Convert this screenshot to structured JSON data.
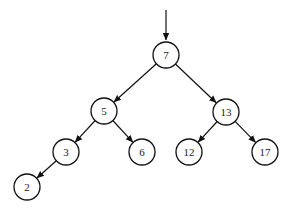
{
  "diagram": {
    "type": "binary-search-tree",
    "colors": {
      "stroke": "#111111",
      "text": "#222222",
      "background": "#ffffff"
    },
    "entry_arrow": {
      "x": 166,
      "y1": 10,
      "y2": 40
    },
    "node_radius": 13,
    "nodes": [
      {
        "id": "n7",
        "label": "7",
        "x": 166,
        "y": 55
      },
      {
        "id": "n5",
        "label": "5",
        "x": 104,
        "y": 111
      },
      {
        "id": "n13",
        "label": "13",
        "x": 226,
        "y": 112
      },
      {
        "id": "n3",
        "label": "3",
        "x": 66,
        "y": 152
      },
      {
        "id": "n6",
        "label": "6",
        "x": 142,
        "y": 152
      },
      {
        "id": "n12",
        "label": "12",
        "x": 189,
        "y": 152
      },
      {
        "id": "n17",
        "label": "17",
        "x": 265,
        "y": 152
      },
      {
        "id": "n2",
        "label": "2",
        "x": 27,
        "y": 187
      }
    ],
    "edges": [
      {
        "from": "n7",
        "to": "n5"
      },
      {
        "from": "n7",
        "to": "n13"
      },
      {
        "from": "n5",
        "to": "n3"
      },
      {
        "from": "n5",
        "to": "n6"
      },
      {
        "from": "n13",
        "to": "n12"
      },
      {
        "from": "n13",
        "to": "n17"
      },
      {
        "from": "n3",
        "to": "n2"
      }
    ]
  }
}
